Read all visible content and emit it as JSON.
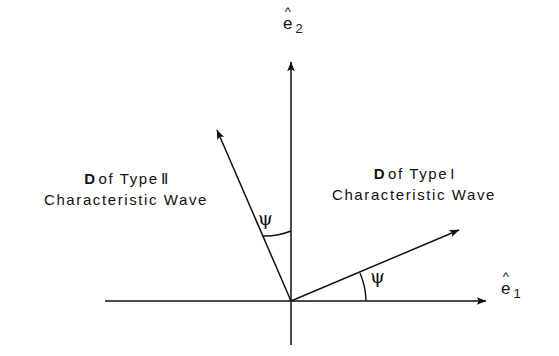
{
  "figure": {
    "background_color": "#ffffff",
    "ink_color": "#111111",
    "width": 559,
    "height": 356
  },
  "axes": {
    "vertical": {
      "label_base": "e",
      "label_hat": "^",
      "label_subscript": "2",
      "name": "e-hat-2"
    },
    "horizontal": {
      "label_base": "e",
      "label_hat": "^",
      "label_subscript": "1",
      "name": "e-hat-1"
    }
  },
  "vectors": {
    "type_one": {
      "bold_symbol": "D",
      "text_after_symbol": "of Type",
      "roman_numeral": "I",
      "line_two": "Characteristic Wave",
      "angle_symbol": "ψ",
      "angle_reference": "horizontal-axis",
      "angle_degrees": 22
    },
    "type_two": {
      "bold_symbol": "D",
      "text_after_symbol": "of Type",
      "roman_numeral": "Ⅱ",
      "line_two": "Characteristic Wave",
      "angle_symbol": "ψ",
      "angle_reference": "vertical-axis",
      "angle_degrees": 21
    }
  }
}
